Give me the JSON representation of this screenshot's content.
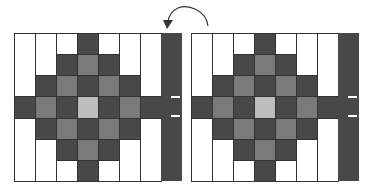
{
  "diagram": {
    "colors": {
      "dark": "#484848",
      "medium": "#7a7a7a",
      "light": "#bdbdbd",
      "white": "#ffffff",
      "border": "#333333",
      "strip": "#484848"
    },
    "pattern": [
      [
        "W",
        "W",
        "W",
        "D",
        "W",
        "W",
        "W"
      ],
      [
        "W",
        "W",
        "D",
        "M",
        "D",
        "W",
        "W"
      ],
      [
        "W",
        "D",
        "M",
        "D",
        "M",
        "D",
        "W"
      ],
      [
        "D",
        "M",
        "D",
        "L",
        "D",
        "M",
        "D"
      ],
      [
        "W",
        "D",
        "M",
        "D",
        "M",
        "D",
        "W"
      ],
      [
        "W",
        "W",
        "D",
        "M",
        "D",
        "W",
        "W"
      ],
      [
        "W",
        "W",
        "W",
        "D",
        "W",
        "W",
        "W"
      ]
    ],
    "grids": [
      {
        "name": "left-grid",
        "x": 14
      },
      {
        "name": "right-grid",
        "x": 191
      }
    ],
    "arrow": {
      "from": "right-grid",
      "to": "left-grid-strip"
    }
  }
}
